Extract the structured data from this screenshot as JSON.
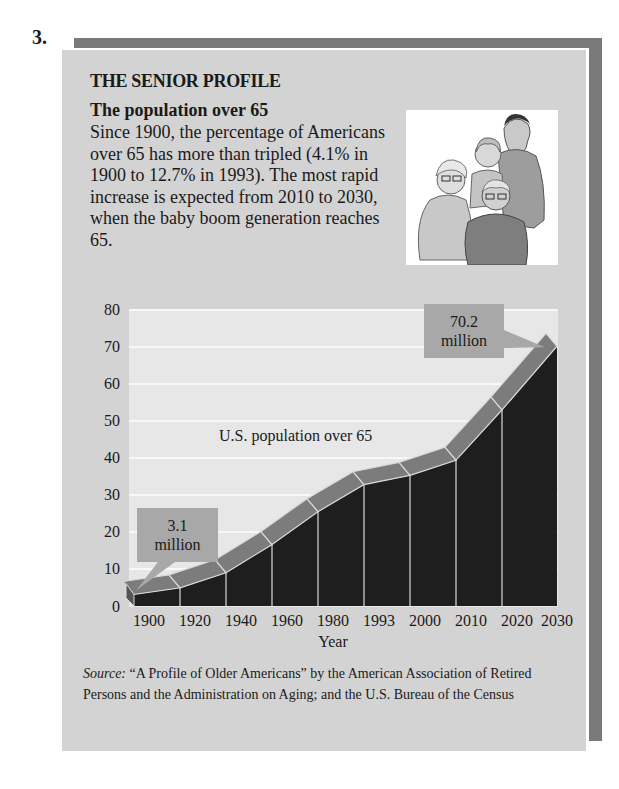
{
  "item_number": "3.",
  "panel": {
    "title": "THE SENIOR PROFILE",
    "subtitle": "The population over 65",
    "body": "Since 1900, the percentage of Americans over 65 has more than tripled (4.1% in 1900 to 12.7% in 1993). The most rapid increase is expected from 2010 to 2030, when the baby boom generation reaches 65.",
    "illustration": "family-of-four-seniors-illustration"
  },
  "chart_data": {
    "type": "area",
    "title": "",
    "series_label": "U.S. population over 65",
    "categories": [
      "1900",
      "1920",
      "1940",
      "1960",
      "1980",
      "1993",
      "2000",
      "2010",
      "2020",
      "2030"
    ],
    "series": [
      {
        "name": "U.S. population over 65 (millions)",
        "values": [
          3.1,
          4.9,
          9.0,
          16.6,
          25.5,
          32.8,
          35.3,
          39.4,
          53.0,
          70.2
        ]
      }
    ],
    "xlabel": "Year",
    "ylabel": "",
    "ylim": [
      0,
      80
    ],
    "yticks": [
      0,
      10,
      20,
      30,
      40,
      50,
      60,
      70,
      80
    ],
    "grid": true,
    "annotations": [
      {
        "category": "1900",
        "line1": "3.1",
        "line2": "million"
      },
      {
        "category": "2030",
        "line1": "70.2",
        "line2": "million"
      }
    ],
    "colors": {
      "fill": "#1e1e1e",
      "ribbon": "#7c7c7c",
      "plot_bg": "#e7e7e7",
      "grid": "#f8f8f8",
      "callout": "#a8a8a8"
    }
  },
  "source": {
    "prefix": "Source:",
    "text": " “A Profile of Older Americans” by the American Association of Retired Persons and the Administration on Aging; and the U.S. Bureau of the Census"
  }
}
